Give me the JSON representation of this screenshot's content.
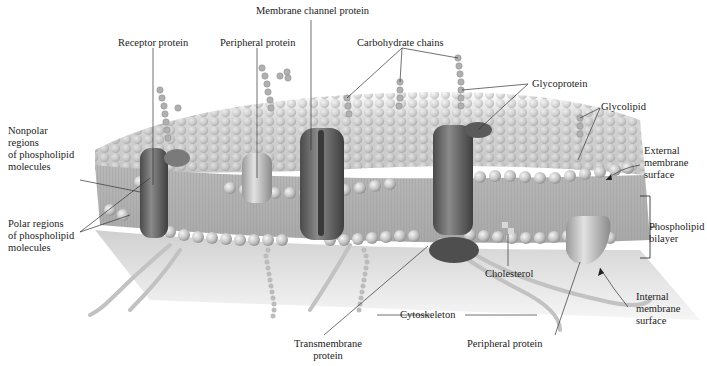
{
  "figure": {
    "labels": {
      "receptor_protein": "Receptor protein",
      "peripheral_protein_top": "Peripheral protein",
      "membrane_channel_protein": "Membrane channel protein",
      "carbohydrate_chains": "Carbohydrate chains",
      "glycoprotein": "Glycoprotein",
      "glycolipid": "Glycolipid",
      "nonpolar_regions": [
        "Nonpolar",
        "regions",
        "of phospholipid",
        "molecules"
      ],
      "polar_regions": [
        "Polar regions",
        "of phospholipid",
        "molecules"
      ],
      "external_membrane_surface": [
        "External",
        "membrane",
        "surface"
      ],
      "phospholipid_bilayer": [
        "Phospholipid",
        "bilayer"
      ],
      "cholesterol": "Cholesterol",
      "internal_membrane_surface": [
        "Internal",
        "membrane",
        "surface"
      ],
      "cytoskeleton": "Cytoskeleton",
      "transmembrane_protein": [
        "Transmembrane",
        "protein"
      ],
      "peripheral_protein_bottom": "Peripheral protein"
    },
    "colors": {
      "background": "#ffffff",
      "membrane_light": "#e4e4e4",
      "membrane_mid": "#c8c8c8",
      "phospholipid_head": "#bdbdbd",
      "protein_dark": "#6e6e6e",
      "protein_light": "#b5b5b5",
      "leader_line": "#333333"
    }
  }
}
